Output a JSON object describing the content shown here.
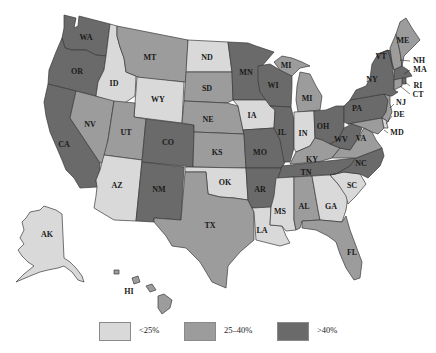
{
  "title": "",
  "colors": {
    "low": "#d9d9d9",
    "mid": "#9c9c9c",
    "high": "#6a6a6a",
    "border": "#3a3a3a",
    "background": "#ffffff"
  },
  "legend": [
    {
      "key": "low",
      "label": "<25%",
      "color": "#d9d9d9"
    },
    {
      "key": "mid",
      "label": "25–40%",
      "color": "#9c9c9c"
    },
    {
      "key": "high",
      "label": ">40%",
      "color": "#6a6a6a"
    }
  ],
  "states": {
    "WA": {
      "label": "WA",
      "category": "high"
    },
    "OR": {
      "label": "OR",
      "category": "high"
    },
    "CA": {
      "label": "CA",
      "category": "high"
    },
    "ID": {
      "label": "ID",
      "category": "low"
    },
    "NV": {
      "label": "NV",
      "category": "mid"
    },
    "MT": {
      "label": "MT",
      "category": "mid"
    },
    "WY": {
      "label": "WY",
      "category": "low"
    },
    "UT": {
      "label": "UT",
      "category": "mid"
    },
    "AZ": {
      "label": "AZ",
      "category": "low"
    },
    "CO": {
      "label": "CO",
      "category": "high"
    },
    "NM": {
      "label": "NM",
      "category": "high"
    },
    "ND": {
      "label": "ND",
      "category": "low"
    },
    "SD": {
      "label": "SD",
      "category": "mid"
    },
    "NE": {
      "label": "NE",
      "category": "mid"
    },
    "KS": {
      "label": "KS",
      "category": "mid"
    },
    "OK": {
      "label": "OK",
      "category": "low"
    },
    "TX": {
      "label": "TX",
      "category": "mid"
    },
    "MN": {
      "label": "MN",
      "category": "high"
    },
    "IA": {
      "label": "IA",
      "category": "low"
    },
    "MO": {
      "label": "MO",
      "category": "high"
    },
    "AR": {
      "label": "AR",
      "category": "high"
    },
    "LA": {
      "label": "LA",
      "category": "low"
    },
    "WI": {
      "label": "WI",
      "category": "high"
    },
    "IL": {
      "label": "IL",
      "category": "high"
    },
    "MI": {
      "label": "MI",
      "category": "mid"
    },
    "IN": {
      "label": "IN",
      "category": "low"
    },
    "OH": {
      "label": "OH",
      "category": "high"
    },
    "KY": {
      "label": "KY",
      "category": "mid"
    },
    "TN": {
      "label": "TN",
      "category": "high"
    },
    "MS": {
      "label": "MS",
      "category": "low"
    },
    "AL": {
      "label": "AL",
      "category": "mid"
    },
    "GA": {
      "label": "GA",
      "category": "low"
    },
    "FL": {
      "label": "FL",
      "category": "mid"
    },
    "SC": {
      "label": "SC",
      "category": "low"
    },
    "NC": {
      "label": "NC",
      "category": "high"
    },
    "VA": {
      "label": "VA",
      "category": "mid"
    },
    "WV": {
      "label": "WV",
      "category": "high"
    },
    "PA": {
      "label": "PA",
      "category": "high"
    },
    "NY": {
      "label": "NY",
      "category": "high"
    },
    "VT": {
      "label": "VT",
      "category": "high"
    },
    "NH": {
      "label": "NH",
      "category": "mid"
    },
    "ME": {
      "label": "ME",
      "category": "mid"
    },
    "MA": {
      "label": "MA",
      "category": "high"
    },
    "RI": {
      "label": "RI",
      "category": "high"
    },
    "CT": {
      "label": "CT",
      "category": "mid"
    },
    "NJ": {
      "label": "NJ",
      "category": "mid"
    },
    "DE": {
      "label": "DE",
      "category": "low"
    },
    "MD": {
      "label": "MD",
      "category": "mid"
    },
    "AK": {
      "label": "AK",
      "category": "low"
    },
    "HI": {
      "label": "HI",
      "category": "mid"
    }
  }
}
